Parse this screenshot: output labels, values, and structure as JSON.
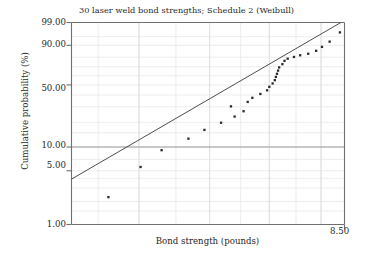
{
  "chart_data": {
    "type": "scatter",
    "title": "30 laser weld bond strengths; Schedule 2 (Weibull)",
    "xlabel": "Bond strength (pounds)",
    "ylabel": "Cumulative probability (%)",
    "plot_kind": "weibull-probability-plot",
    "grid": true,
    "legend": null,
    "xscale": "log",
    "yscale": "weibull",
    "xlim": [
      4.2,
      8.5
    ],
    "ylim": [
      1.0,
      99.0
    ],
    "x_tick_labels": [
      "8.50"
    ],
    "x_tick_values": [
      8.5
    ],
    "y_tick_labels": [
      "99.00",
      "90.00",
      "50.00",
      "10.00",
      "5.00",
      "1.00"
    ],
    "y_tick_values": [
      99.0,
      90.0,
      50.0,
      10.0,
      5.0,
      1.0
    ],
    "series": [
      {
        "name": "Bond strength order statistics",
        "marker": "square",
        "marker_color": "#2a2a2a",
        "marker_size": 2.3,
        "points": [
          {
            "x": 4.62,
            "y": 2.28
          },
          {
            "x": 5.02,
            "y": 5.59
          },
          {
            "x": 5.3,
            "y": 9.13
          },
          {
            "x": 5.68,
            "y": 12.7
          },
          {
            "x": 5.92,
            "y": 16.23
          },
          {
            "x": 6.18,
            "y": 19.76
          },
          {
            "x": 6.4,
            "y": 23.3
          },
          {
            "x": 6.55,
            "y": 26.83
          },
          {
            "x": 6.34,
            "y": 30.36
          },
          {
            "x": 6.62,
            "y": 33.9
          },
          {
            "x": 6.7,
            "y": 37.43
          },
          {
            "x": 6.84,
            "y": 40.96
          },
          {
            "x": 6.96,
            "y": 44.49
          },
          {
            "x": 7.0,
            "y": 48.03
          },
          {
            "x": 7.06,
            "y": 51.56
          },
          {
            "x": 7.1,
            "y": 55.09
          },
          {
            "x": 7.12,
            "y": 58.63
          },
          {
            "x": 7.14,
            "y": 62.16
          },
          {
            "x": 7.16,
            "y": 65.69
          },
          {
            "x": 7.18,
            "y": 69.23
          },
          {
            "x": 7.24,
            "y": 72.76
          },
          {
            "x": 7.28,
            "y": 76.29
          },
          {
            "x": 7.34,
            "y": 78.5
          },
          {
            "x": 7.46,
            "y": 80.2
          },
          {
            "x": 7.58,
            "y": 81.8
          },
          {
            "x": 7.74,
            "y": 83.2
          },
          {
            "x": 7.9,
            "y": 85.8
          },
          {
            "x": 8.02,
            "y": 88.9
          },
          {
            "x": 8.18,
            "y": 92.4
          },
          {
            "x": 8.4,
            "y": 96.7
          }
        ]
      }
    ],
    "fit_line": {
      "name": "Weibull fit line",
      "color": "#3a3a3a",
      "endpoints": [
        {
          "x": 4.2,
          "y": 3.9
        },
        {
          "x": 8.42,
          "y": 99.0
        }
      ]
    },
    "gridlines": {
      "horizontal_major_values": [
        10.0
      ],
      "horizontal_minor_count": 14,
      "vertical_minor_count": 5
    },
    "colors": {
      "axis": "#6f6f6f",
      "grid_major": "#9a9a9a",
      "grid_minor": "#e8e8e8",
      "marker": "#2a2a2a",
      "fit_line": "#3a3a3a",
      "text": "#1f1f1f",
      "background": "#ffffff"
    }
  }
}
